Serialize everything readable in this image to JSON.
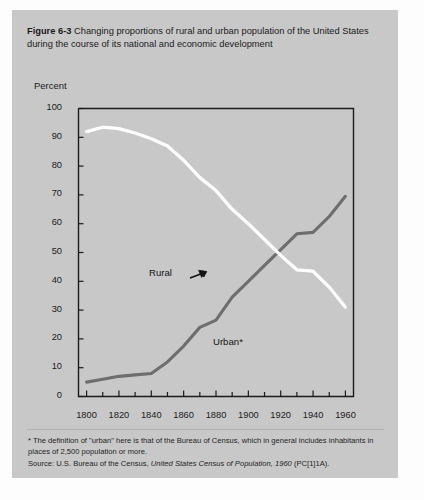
{
  "figure": {
    "number": "Figure 6-3",
    "caption": "Changing proportions of rural and urban population of the United States during the course of its national and economic development"
  },
  "axis": {
    "y_title": "Percent",
    "y_ticks": [
      "0",
      "10",
      "20",
      "30",
      "40",
      "50",
      "60",
      "70",
      "80",
      "90",
      "100"
    ],
    "x_ticks_major": [
      "1800",
      "1820",
      "1840",
      "1860",
      "1880",
      "1900",
      "1920",
      "1940",
      "1960"
    ]
  },
  "series_labels": {
    "rural": "Rural",
    "urban": "Urban*"
  },
  "notes": {
    "footnote": "* The definition of \"urban\" here is that of the Bureau of Census, which in general includes inhabitants in places of 2,500 population or more.",
    "source_prefix": "Source: U.S. Bureau of the Census, ",
    "source_italic": "United States Census of Population, 1960",
    "source_suffix": " (PC[1]1A)."
  },
  "colors": {
    "card_background": "#c8c8c8",
    "rural_line": "#ffffff",
    "urban_line": "#6e6e6e",
    "axis": "#1b1b1b",
    "text": "#1b1b1b"
  },
  "chart_data": {
    "type": "line",
    "title": "Changing proportions of rural and urban population of the United States during the course of its national and economic development",
    "xlabel": "",
    "ylabel": "Percent",
    "xlim": [
      1795,
      1965
    ],
    "ylim": [
      0,
      100
    ],
    "grid": false,
    "legend": "inline-annotations",
    "x": [
      1800,
      1810,
      1820,
      1830,
      1840,
      1850,
      1860,
      1870,
      1880,
      1890,
      1900,
      1910,
      1920,
      1930,
      1940,
      1950,
      1960
    ],
    "series": [
      {
        "name": "Rural",
        "color": "#ffffff",
        "values": [
          92.0,
          93.5,
          93.0,
          91.5,
          89.5,
          87.0,
          82.0,
          76.0,
          71.5,
          65.0,
          60.0,
          54.5,
          49.0,
          44.0,
          43.5,
          38.0,
          31.0
        ]
      },
      {
        "name": "Urban*",
        "color": "#6e6e6e",
        "values": [
          5.0,
          6.0,
          7.0,
          7.5,
          8.0,
          12.0,
          17.5,
          24.0,
          26.5,
          34.5,
          40.0,
          45.5,
          51.0,
          56.5,
          57.0,
          62.5,
          69.5
        ]
      }
    ],
    "annotations": [
      {
        "text": "Rural",
        "x": 1842,
        "y": 70,
        "points_to": [
          1862,
          73
        ]
      },
      {
        "text": "Urban*",
        "x": 1886,
        "y": 30,
        "points_to": [
          1875,
          27
        ]
      }
    ]
  }
}
